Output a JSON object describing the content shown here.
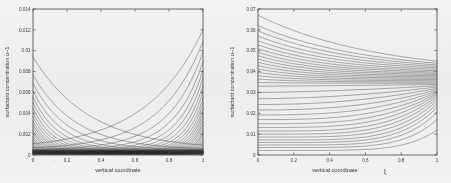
{
  "figure": {
    "background_color": "#f1f1ef",
    "ink_color": "#232323",
    "panels": [
      "left",
      "right"
    ]
  },
  "chart_data": [
    {
      "id": "left-panel",
      "type": "line",
      "title": "",
      "xlabel": "vertical coordinate",
      "ylabel": "surfactant concentration u−1",
      "xlim": [
        0,
        1
      ],
      "ylim": [
        0,
        0.014
      ],
      "xticks": [
        0,
        0.2,
        0.4,
        0.6,
        0.8,
        1
      ],
      "xticklabels": [
        "0",
        "0.2",
        "0.4",
        "0.6",
        "0.8",
        "1"
      ],
      "yticks": [
        0,
        0.002,
        0.004,
        0.006,
        0.008,
        0.01,
        0.012,
        0.014
      ],
      "yticklabels": [
        "0",
        "0.002",
        "0.004",
        "0.006",
        "0.008",
        "0.01",
        "0.012",
        "0.014"
      ],
      "grid": false,
      "legend": null,
      "n_curves": 30,
      "description": "Family of surfactant concentration profiles forming a U-shaped envelope; curves decay from the left wall and rise steeply at the right wall, crossing to form a dense lattice/crosshatch pattern in the interior.",
      "envelope_left_max": 0.0089,
      "envelope_right_max": 0.0115,
      "envelope_min": 0.0005,
      "series": [
        {
          "name": "profile-1",
          "peak_left": 0.0089,
          "peak_right": 0.0115
        },
        {
          "name": "profile-2",
          "peak_left": 0.0072,
          "peak_right": 0.0104
        },
        {
          "name": "profile-3",
          "peak_left": 0.0064,
          "peak_right": 0.0094
        },
        {
          "name": "profile-4",
          "peak_left": 0.0057,
          "peak_right": 0.0085
        },
        {
          "name": "profile-5",
          "peak_left": 0.0051,
          "peak_right": 0.0077
        },
        {
          "name": "profile-6",
          "peak_left": 0.0046,
          "peak_right": 0.007
        },
        {
          "name": "profile-7",
          "peak_left": 0.0041,
          "peak_right": 0.0063
        },
        {
          "name": "profile-8",
          "peak_left": 0.0037,
          "peak_right": 0.0057
        },
        {
          "name": "profile-9",
          "peak_left": 0.0033,
          "peak_right": 0.0051
        },
        {
          "name": "profile-10",
          "peak_left": 0.0029,
          "peak_right": 0.0046
        },
        {
          "name": "profile-11",
          "peak_left": 0.0026,
          "peak_right": 0.0041
        },
        {
          "name": "profile-12",
          "peak_left": 0.0023,
          "peak_right": 0.0037
        },
        {
          "name": "profile-13",
          "peak_left": 0.002,
          "peak_right": 0.0033
        },
        {
          "name": "profile-14",
          "peak_left": 0.0018,
          "peak_right": 0.0029
        },
        {
          "name": "profile-15",
          "peak_left": 0.0015,
          "peak_right": 0.0026
        },
        {
          "name": "profile-16",
          "peak_left": 0.0013,
          "peak_right": 0.0022
        },
        {
          "name": "profile-17",
          "peak_left": 0.0011,
          "peak_right": 0.0019
        },
        {
          "name": "profile-18",
          "peak_left": 0.001,
          "peak_right": 0.0017
        },
        {
          "name": "profile-19",
          "peak_left": 0.0008,
          "peak_right": 0.0014
        },
        {
          "name": "profile-20",
          "peak_left": 0.0007,
          "peak_right": 0.0012
        },
        {
          "name": "profile-21",
          "peak_left": 0.0006,
          "peak_right": 0.001
        },
        {
          "name": "profile-22",
          "peak_left": 0.0005,
          "peak_right": 0.0009
        },
        {
          "name": "profile-23",
          "peak_left": 0.0004,
          "peak_right": 0.0007
        },
        {
          "name": "profile-24",
          "peak_left": 0.0003,
          "peak_right": 0.0006
        },
        {
          "name": "profile-25",
          "peak_left": 0.0003,
          "peak_right": 0.0005
        },
        {
          "name": "profile-26",
          "peak_left": 0.0002,
          "peak_right": 0.0004
        },
        {
          "name": "profile-27",
          "peak_left": 0.0002,
          "peak_right": 0.0003
        },
        {
          "name": "profile-28",
          "peak_left": 0.0001,
          "peak_right": 0.0002
        },
        {
          "name": "profile-29",
          "peak_left": 0.0001,
          "peak_right": 0.0002
        },
        {
          "name": "profile-30",
          "peak_left": 0.0001,
          "peak_right": 0.0001
        }
      ]
    },
    {
      "id": "right-panel",
      "type": "line",
      "title": "",
      "xlabel": "vertical coordinate",
      "xlabel_symbol": "ξ",
      "ylabel": "surfactant concentration u−1",
      "xlim": [
        0,
        1
      ],
      "ylim": [
        0,
        0.07
      ],
      "xticks": [
        0,
        0.2,
        0.4,
        0.6,
        0.8,
        1
      ],
      "xticklabels": [
        "0",
        "0.2",
        "0.4",
        "0.6",
        "0.8",
        "1"
      ],
      "yticks": [
        0,
        0.01,
        0.02,
        0.03,
        0.04,
        0.05,
        0.06,
        0.07
      ],
      "yticklabels": [
        "0",
        "0.01",
        "0.02",
        "0.03",
        "0.04",
        "0.05",
        "0.06",
        "0.07"
      ],
      "grid": false,
      "legend": null,
      "n_curves": 34,
      "description": "Two interleaved families of profiles: upper curves start high at the left wall near 0.067 and decay monotonically toward a dense converged band near 0.033-0.045 at the right; lower curves start near zero at the left, rise monotonically, and merge into the same band at the right edge.",
      "upper_start_max": 0.067,
      "band_right_top": 0.045,
      "band_right_bottom": 0.03,
      "series": [
        {
          "name": "decaying-1",
          "start": 0.067,
          "end": 0.045
        },
        {
          "name": "decaying-2",
          "start": 0.062,
          "end": 0.044
        },
        {
          "name": "decaying-3",
          "start": 0.0595,
          "end": 0.0432
        },
        {
          "name": "decaying-4",
          "start": 0.057,
          "end": 0.0425
        },
        {
          "name": "decaying-5",
          "start": 0.0548,
          "end": 0.0418
        },
        {
          "name": "decaying-6",
          "start": 0.0528,
          "end": 0.0411
        },
        {
          "name": "decaying-7",
          "start": 0.051,
          "end": 0.0404
        },
        {
          "name": "decaying-8",
          "start": 0.0492,
          "end": 0.0398
        },
        {
          "name": "decaying-9",
          "start": 0.0476,
          "end": 0.0392
        },
        {
          "name": "decaying-10",
          "start": 0.046,
          "end": 0.0386
        },
        {
          "name": "decaying-11",
          "start": 0.0444,
          "end": 0.038
        },
        {
          "name": "decaying-12",
          "start": 0.0428,
          "end": 0.0374
        },
        {
          "name": "decaying-13",
          "start": 0.0412,
          "end": 0.0368
        },
        {
          "name": "decaying-14",
          "start": 0.0396,
          "end": 0.0362
        },
        {
          "name": "decaying-15",
          "start": 0.038,
          "end": 0.0356
        },
        {
          "name": "decaying-16",
          "start": 0.0364,
          "end": 0.035
        },
        {
          "name": "decaying-17",
          "start": 0.0348,
          "end": 0.0344
        },
        {
          "name": "rising-1",
          "start": 0.033,
          "end": 0.0338
        },
        {
          "name": "rising-2",
          "start": 0.03,
          "end": 0.0332
        },
        {
          "name": "rising-3",
          "start": 0.027,
          "end": 0.0326
        },
        {
          "name": "rising-4",
          "start": 0.0242,
          "end": 0.032
        },
        {
          "name": "rising-5",
          "start": 0.0216,
          "end": 0.0314
        },
        {
          "name": "rising-6",
          "start": 0.0192,
          "end": 0.0308
        },
        {
          "name": "rising-7",
          "start": 0.017,
          "end": 0.0302
        },
        {
          "name": "rising-8",
          "start": 0.015,
          "end": 0.0296
        },
        {
          "name": "rising-9",
          "start": 0.0132,
          "end": 0.029
        },
        {
          "name": "rising-10",
          "start": 0.0115,
          "end": 0.0282
        },
        {
          "name": "rising-11",
          "start": 0.01,
          "end": 0.0272
        },
        {
          "name": "rising-12",
          "start": 0.0086,
          "end": 0.026
        },
        {
          "name": "rising-13",
          "start": 0.0072,
          "end": 0.0245
        },
        {
          "name": "rising-14",
          "start": 0.006,
          "end": 0.0228
        },
        {
          "name": "rising-15",
          "start": 0.0048,
          "end": 0.0205
        },
        {
          "name": "rising-16",
          "start": 0.0036,
          "end": 0.017
        },
        {
          "name": "rising-17",
          "start": 0.0022,
          "end": 0.012
        }
      ]
    }
  ]
}
